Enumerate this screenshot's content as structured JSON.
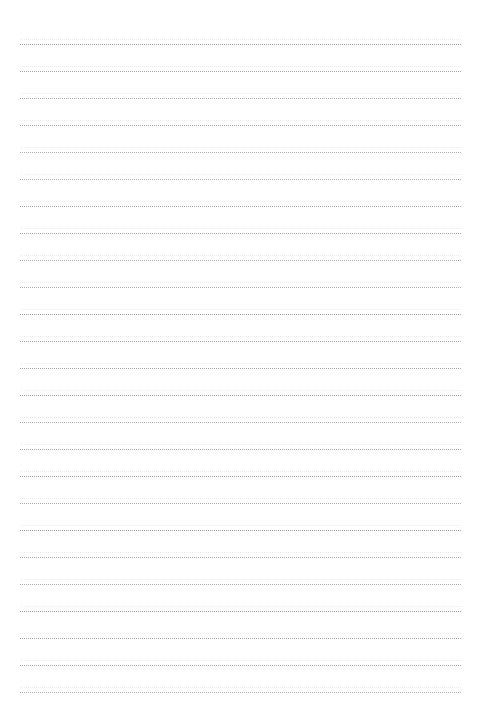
{
  "page": {
    "kind": "dotted-ruled-paper",
    "width": 480,
    "height": 720,
    "background_color": "#ffffff",
    "content_text": "",
    "sheet_label": ""
  },
  "rules": {
    "count": 25,
    "first_line_y": 44,
    "line_spacing": 27,
    "left_margin_x": 20,
    "right_edge_x": 461,
    "line_width": 441,
    "style": "dotted",
    "dot_pitch": 2,
    "dot_color": "#6c6e78",
    "ghost_dot_color": "#9696a0",
    "ghost_offset_y": -5,
    "lines": [
      {
        "index": 1,
        "y": 44,
        "text": ""
      },
      {
        "index": 2,
        "y": 71,
        "text": ""
      },
      {
        "index": 3,
        "y": 98,
        "text": ""
      },
      {
        "index": 4,
        "y": 125,
        "text": ""
      },
      {
        "index": 5,
        "y": 152,
        "text": ""
      },
      {
        "index": 6,
        "y": 179,
        "text": ""
      },
      {
        "index": 7,
        "y": 206,
        "text": ""
      },
      {
        "index": 8,
        "y": 233,
        "text": ""
      },
      {
        "index": 9,
        "y": 260,
        "text": ""
      },
      {
        "index": 10,
        "y": 287,
        "text": ""
      },
      {
        "index": 11,
        "y": 314,
        "text": ""
      },
      {
        "index": 12,
        "y": 341,
        "text": ""
      },
      {
        "index": 13,
        "y": 368,
        "text": ""
      },
      {
        "index": 14,
        "y": 395,
        "text": ""
      },
      {
        "index": 15,
        "y": 422,
        "text": ""
      },
      {
        "index": 16,
        "y": 449,
        "text": ""
      },
      {
        "index": 17,
        "y": 476,
        "text": ""
      },
      {
        "index": 18,
        "y": 503,
        "text": ""
      },
      {
        "index": 19,
        "y": 530,
        "text": ""
      },
      {
        "index": 20,
        "y": 557,
        "text": ""
      },
      {
        "index": 21,
        "y": 584,
        "text": ""
      },
      {
        "index": 22,
        "y": 611,
        "text": ""
      },
      {
        "index": 23,
        "y": 638,
        "text": ""
      },
      {
        "index": 24,
        "y": 665,
        "text": ""
      },
      {
        "index": 25,
        "y": 692,
        "text": ""
      }
    ]
  }
}
